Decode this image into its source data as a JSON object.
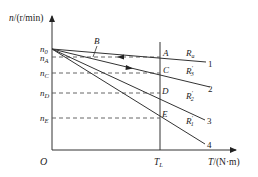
{
  "diagram": {
    "title": "",
    "axes": {
      "y_label": "n/(r/min)",
      "x_label": "T/(N·m)",
      "origin_label": "O",
      "x_tick_label": "T_L"
    },
    "speed_levels": {
      "n0": "n0",
      "nA": "nA",
      "nC": "nC",
      "nD": "nD",
      "nE": "nE"
    },
    "points": {
      "A": "A",
      "B": "B",
      "C": "C",
      "D": "D",
      "E": "E"
    },
    "lines": [
      {
        "number": "1",
        "resistance": "Ra"
      },
      {
        "number": "2",
        "resistance": "R'3"
      },
      {
        "number": "3",
        "resistance": "R'2"
      },
      {
        "number": "4",
        "resistance": "R'1"
      }
    ],
    "colors": {
      "stroke": "#333333",
      "background": "#ffffff"
    }
  }
}
